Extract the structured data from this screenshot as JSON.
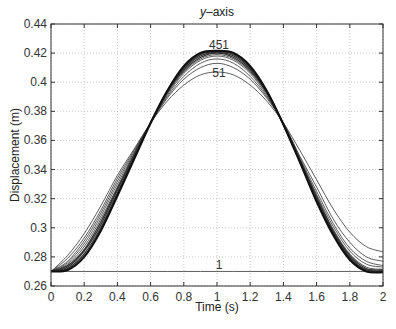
{
  "chart_data": {
    "type": "line",
    "title": "y–axis",
    "title_italic_part": "y",
    "title_rest": "–axis",
    "xlabel": "Time (s)",
    "ylabel": "Displacement (m)",
    "xlim": [
      0,
      2
    ],
    "ylim": [
      0.26,
      0.44
    ],
    "xticks": [
      "0",
      "0.2",
      "0.4",
      "0.6",
      "0.8",
      "1",
      "1.2",
      "1.4",
      "1.6",
      "1.8",
      "2"
    ],
    "yticks": [
      "0.26",
      "0.28",
      "0.3",
      "0.32",
      "0.34",
      "0.36",
      "0.38",
      "0.4",
      "0.42",
      "0.44"
    ],
    "grid": true,
    "annotations": [
      {
        "text": "451",
        "x": 1.0,
        "y": 0.4225
      },
      {
        "text": "51",
        "x": 1.0,
        "y": 0.4035
      },
      {
        "text": "1",
        "x": 1.0,
        "y": 0.2715
      }
    ],
    "x": [
      0,
      0.1,
      0.2,
      0.3,
      0.4,
      0.5,
      0.6,
      0.7,
      0.8,
      0.9,
      1.0,
      1.1,
      1.2,
      1.3,
      1.4,
      1.5,
      1.6,
      1.7,
      1.8,
      1.9,
      2.0
    ],
    "series": [
      {
        "name": "1",
        "values": [
          0.27,
          0.27,
          0.27,
          0.27,
          0.27,
          0.27,
          0.27,
          0.27,
          0.27,
          0.27,
          0.27,
          0.27,
          0.27,
          0.27,
          0.27,
          0.27,
          0.27,
          0.27,
          0.27,
          0.27,
          0.27
        ]
      },
      {
        "name": "51",
        "values": [
          0.27,
          0.281,
          0.296,
          0.315,
          0.336,
          0.354,
          0.372,
          0.387,
          0.398,
          0.405,
          0.407,
          0.405,
          0.398,
          0.387,
          0.372,
          0.353,
          0.333,
          0.313,
          0.297,
          0.287,
          0.2835
        ]
      },
      {
        "name": "101",
        "values": [
          0.27,
          0.279,
          0.293,
          0.312,
          0.334,
          0.353,
          0.372,
          0.389,
          0.402,
          0.41,
          0.413,
          0.41,
          0.402,
          0.389,
          0.372,
          0.349,
          0.328,
          0.306,
          0.29,
          0.28,
          0.277
        ]
      },
      {
        "name": "151",
        "values": [
          0.27,
          0.277,
          0.291,
          0.31,
          0.332,
          0.352,
          0.372,
          0.39,
          0.404,
          0.413,
          0.416,
          0.413,
          0.404,
          0.39,
          0.372,
          0.348,
          0.325,
          0.303,
          0.286,
          0.277,
          0.274
        ]
      },
      {
        "name": "201",
        "values": [
          0.27,
          0.276,
          0.289,
          0.308,
          0.33,
          0.351,
          0.372,
          0.391,
          0.406,
          0.415,
          0.418,
          0.415,
          0.406,
          0.391,
          0.371,
          0.347,
          0.323,
          0.301,
          0.284,
          0.275,
          0.273
        ]
      },
      {
        "name": "251",
        "values": [
          0.27,
          0.275,
          0.287,
          0.306,
          0.328,
          0.35,
          0.372,
          0.392,
          0.407,
          0.416,
          0.419,
          0.416,
          0.407,
          0.392,
          0.371,
          0.347,
          0.322,
          0.299,
          0.282,
          0.273,
          0.2715
        ]
      },
      {
        "name": "301",
        "values": [
          0.27,
          0.274,
          0.285,
          0.304,
          0.327,
          0.35,
          0.372,
          0.393,
          0.408,
          0.417,
          0.42,
          0.417,
          0.408,
          0.393,
          0.371,
          0.346,
          0.321,
          0.298,
          0.281,
          0.272,
          0.271
        ]
      },
      {
        "name": "351",
        "values": [
          0.27,
          0.273,
          0.284,
          0.302,
          0.326,
          0.349,
          0.372,
          0.393,
          0.409,
          0.418,
          0.4205,
          0.418,
          0.409,
          0.393,
          0.371,
          0.346,
          0.32,
          0.297,
          0.28,
          0.271,
          0.2705
        ]
      },
      {
        "name": "401",
        "values": [
          0.27,
          0.272,
          0.282,
          0.3,
          0.324,
          0.348,
          0.372,
          0.394,
          0.41,
          0.419,
          0.421,
          0.419,
          0.41,
          0.394,
          0.371,
          0.345,
          0.319,
          0.296,
          0.279,
          0.271,
          0.27
        ]
      },
      {
        "name": "451",
        "values": [
          0.27,
          0.271,
          0.28,
          0.298,
          0.322,
          0.347,
          0.372,
          0.394,
          0.411,
          0.42,
          0.4215,
          0.42,
          0.411,
          0.394,
          0.371,
          0.345,
          0.318,
          0.295,
          0.278,
          0.27,
          0.2695
        ]
      }
    ]
  }
}
